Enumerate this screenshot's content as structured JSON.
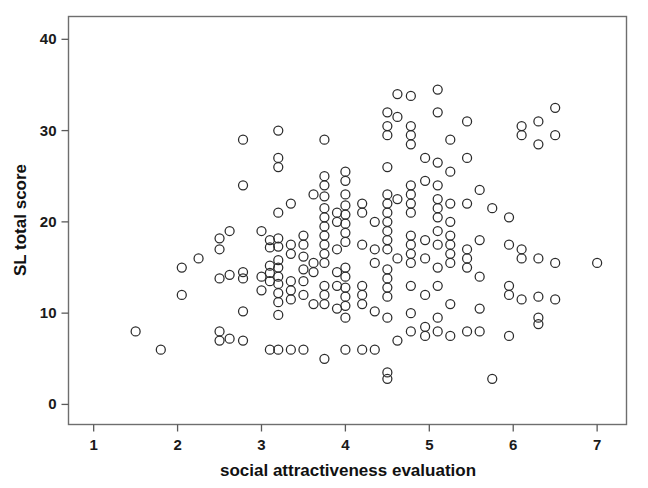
{
  "figure": {
    "background_color": "#ffffff",
    "frame_color": "#6e6e6e",
    "marker_color": "#2b2b2b",
    "text_color": "#111111"
  },
  "chart_data": {
    "type": "scatter",
    "title": "",
    "xlabel": "social attractiveness evaluation",
    "ylabel": "SL total score",
    "xlim": [
      0.7,
      7.35
    ],
    "ylim": [
      -2.2,
      42.5
    ],
    "xticks": [
      1,
      2,
      3,
      4,
      5,
      6,
      7
    ],
    "xticklabels": [
      "1",
      "2",
      "3",
      "4",
      "5",
      "6",
      "7"
    ],
    "yticks": [
      0,
      10,
      20,
      30,
      40
    ],
    "yticklabels": [
      "0",
      "10",
      "20",
      "30",
      "40"
    ],
    "grid": false,
    "legend": null,
    "marker_style": "open-circle",
    "marker_size": 9,
    "n_points": 232,
    "points": [
      [
        1.5,
        8.0
      ],
      [
        1.8,
        6.0
      ],
      [
        2.05,
        15.0
      ],
      [
        2.05,
        12.0
      ],
      [
        2.25,
        16.0
      ],
      [
        2.5,
        18.2
      ],
      [
        2.5,
        17.0
      ],
      [
        2.5,
        13.8
      ],
      [
        2.5,
        8.0
      ],
      [
        2.5,
        7.0
      ],
      [
        2.62,
        19.0
      ],
      [
        2.62,
        14.2
      ],
      [
        2.62,
        7.2
      ],
      [
        2.78,
        29.0
      ],
      [
        2.78,
        24.0
      ],
      [
        2.78,
        14.5
      ],
      [
        2.78,
        13.8
      ],
      [
        2.78,
        10.2
      ],
      [
        2.78,
        7.0
      ],
      [
        3.0,
        19.0
      ],
      [
        3.0,
        14.0
      ],
      [
        3.0,
        12.5
      ],
      [
        3.1,
        18.0
      ],
      [
        3.1,
        17.2
      ],
      [
        3.1,
        15.2
      ],
      [
        3.1,
        14.4
      ],
      [
        3.1,
        13.5
      ],
      [
        3.1,
        6.0
      ],
      [
        3.2,
        30.0
      ],
      [
        3.2,
        27.0
      ],
      [
        3.2,
        26.0
      ],
      [
        3.2,
        21.0
      ],
      [
        3.2,
        18.2
      ],
      [
        3.2,
        17.3
      ],
      [
        3.2,
        15.8
      ],
      [
        3.2,
        15.0
      ],
      [
        3.2,
        14.0
      ],
      [
        3.2,
        13.2
      ],
      [
        3.2,
        12.2
      ],
      [
        3.2,
        11.2
      ],
      [
        3.2,
        9.8
      ],
      [
        3.2,
        6.0
      ],
      [
        3.35,
        22.0
      ],
      [
        3.35,
        17.5
      ],
      [
        3.35,
        16.5
      ],
      [
        3.35,
        13.5
      ],
      [
        3.35,
        12.5
      ],
      [
        3.35,
        11.5
      ],
      [
        3.35,
        6.0
      ],
      [
        3.5,
        18.5
      ],
      [
        3.5,
        17.5
      ],
      [
        3.5,
        16.2
      ],
      [
        3.5,
        14.8
      ],
      [
        3.5,
        13.5
      ],
      [
        3.5,
        12.0
      ],
      [
        3.5,
        6.0
      ],
      [
        3.62,
        23.0
      ],
      [
        3.62,
        15.5
      ],
      [
        3.62,
        14.5
      ],
      [
        3.62,
        11.0
      ],
      [
        3.75,
        29.0
      ],
      [
        3.75,
        25.0
      ],
      [
        3.75,
        24.0
      ],
      [
        3.75,
        22.8
      ],
      [
        3.75,
        21.5
      ],
      [
        3.75,
        20.5
      ],
      [
        3.75,
        19.5
      ],
      [
        3.75,
        18.5
      ],
      [
        3.75,
        17.5
      ],
      [
        3.75,
        16.5
      ],
      [
        3.75,
        15.5
      ],
      [
        3.75,
        13.0
      ],
      [
        3.75,
        12.0
      ],
      [
        3.75,
        11.0
      ],
      [
        3.75,
        5.0
      ],
      [
        3.9,
        21.0
      ],
      [
        3.9,
        20.0
      ],
      [
        3.9,
        17.0
      ],
      [
        3.9,
        14.5
      ],
      [
        3.9,
        13.0
      ],
      [
        3.9,
        10.5
      ],
      [
        4.0,
        25.5
      ],
      [
        4.0,
        24.5
      ],
      [
        4.0,
        23.0
      ],
      [
        4.0,
        21.8
      ],
      [
        4.0,
        20.8
      ],
      [
        4.0,
        19.8
      ],
      [
        4.0,
        18.8
      ],
      [
        4.0,
        17.8
      ],
      [
        4.0,
        15.0
      ],
      [
        4.0,
        14.0
      ],
      [
        4.0,
        12.8
      ],
      [
        4.0,
        11.8
      ],
      [
        4.0,
        10.8
      ],
      [
        4.0,
        9.5
      ],
      [
        4.0,
        6.0
      ],
      [
        4.2,
        22.0
      ],
      [
        4.2,
        21.0
      ],
      [
        4.2,
        17.5
      ],
      [
        4.2,
        13.0
      ],
      [
        4.2,
        12.0
      ],
      [
        4.2,
        11.0
      ],
      [
        4.2,
        6.0
      ],
      [
        4.35,
        20.0
      ],
      [
        4.35,
        17.0
      ],
      [
        4.35,
        15.5
      ],
      [
        4.35,
        10.2
      ],
      [
        4.35,
        6.0
      ],
      [
        4.5,
        32.0
      ],
      [
        4.5,
        30.5
      ],
      [
        4.5,
        29.5
      ],
      [
        4.5,
        26.0
      ],
      [
        4.5,
        23.0
      ],
      [
        4.5,
        22.0
      ],
      [
        4.5,
        21.0
      ],
      [
        4.5,
        20.0
      ],
      [
        4.5,
        19.0
      ],
      [
        4.5,
        18.0
      ],
      [
        4.5,
        17.0
      ],
      [
        4.5,
        14.8
      ],
      [
        4.5,
        13.8
      ],
      [
        4.5,
        12.8
      ],
      [
        4.5,
        11.8
      ],
      [
        4.5,
        9.5
      ],
      [
        4.5,
        3.5
      ],
      [
        4.5,
        2.8
      ],
      [
        4.62,
        34.0
      ],
      [
        4.62,
        31.5
      ],
      [
        4.62,
        22.5
      ],
      [
        4.62,
        16.0
      ],
      [
        4.62,
        7.0
      ],
      [
        4.78,
        33.8
      ],
      [
        4.78,
        30.5
      ],
      [
        4.78,
        29.5
      ],
      [
        4.78,
        28.5
      ],
      [
        4.78,
        24.0
      ],
      [
        4.78,
        23.0
      ],
      [
        4.78,
        22.0
      ],
      [
        4.78,
        21.0
      ],
      [
        4.78,
        18.5
      ],
      [
        4.78,
        17.5
      ],
      [
        4.78,
        16.5
      ],
      [
        4.78,
        15.5
      ],
      [
        4.78,
        13.0
      ],
      [
        4.78,
        10.0
      ],
      [
        4.78,
        8.0
      ],
      [
        4.95,
        27.0
      ],
      [
        4.95,
        24.5
      ],
      [
        4.95,
        18.0
      ],
      [
        4.95,
        16.0
      ],
      [
        4.95,
        12.0
      ],
      [
        4.95,
        8.5
      ],
      [
        4.95,
        7.5
      ],
      [
        5.1,
        34.5
      ],
      [
        5.1,
        32.0
      ],
      [
        5.1,
        26.5
      ],
      [
        5.1,
        24.0
      ],
      [
        5.1,
        22.5
      ],
      [
        5.1,
        21.5
      ],
      [
        5.1,
        20.5
      ],
      [
        5.1,
        19.0
      ],
      [
        5.1,
        17.5
      ],
      [
        5.1,
        15.0
      ],
      [
        5.1,
        13.0
      ],
      [
        5.1,
        9.5
      ],
      [
        5.1,
        8.0
      ],
      [
        5.25,
        29.0
      ],
      [
        5.25,
        25.5
      ],
      [
        5.25,
        22.0
      ],
      [
        5.25,
        20.0
      ],
      [
        5.25,
        18.5
      ],
      [
        5.25,
        17.5
      ],
      [
        5.25,
        16.5
      ],
      [
        5.25,
        15.5
      ],
      [
        5.25,
        11.0
      ],
      [
        5.25,
        7.5
      ],
      [
        5.45,
        31.0
      ],
      [
        5.45,
        27.0
      ],
      [
        5.45,
        22.0
      ],
      [
        5.45,
        17.0
      ],
      [
        5.45,
        16.0
      ],
      [
        5.45,
        15.0
      ],
      [
        5.45,
        8.0
      ],
      [
        5.6,
        23.5
      ],
      [
        5.6,
        18.0
      ],
      [
        5.6,
        14.0
      ],
      [
        5.6,
        10.5
      ],
      [
        5.6,
        8.0
      ],
      [
        5.75,
        21.5
      ],
      [
        5.75,
        2.8
      ],
      [
        5.95,
        20.5
      ],
      [
        5.95,
        17.5
      ],
      [
        5.95,
        13.0
      ],
      [
        5.95,
        12.0
      ],
      [
        5.95,
        7.5
      ],
      [
        6.1,
        30.5
      ],
      [
        6.1,
        29.5
      ],
      [
        6.1,
        17.0
      ],
      [
        6.1,
        16.0
      ],
      [
        6.1,
        11.5
      ],
      [
        6.3,
        31.0
      ],
      [
        6.3,
        28.5
      ],
      [
        6.3,
        16.0
      ],
      [
        6.3,
        11.8
      ],
      [
        6.3,
        9.5
      ],
      [
        6.3,
        8.8
      ],
      [
        6.5,
        32.5
      ],
      [
        6.5,
        29.5
      ],
      [
        6.5,
        15.5
      ],
      [
        6.5,
        11.5
      ],
      [
        7.0,
        15.5
      ]
    ]
  }
}
